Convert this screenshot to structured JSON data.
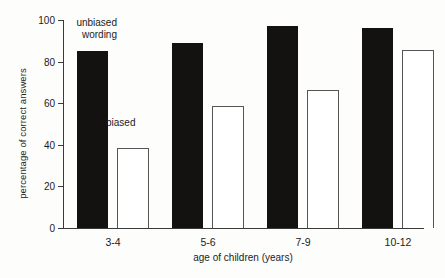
{
  "chart_data": {
    "type": "bar",
    "title": "",
    "subtitle": "",
    "xlabel": "age of children (years)",
    "ylabel": "percentage of correct answers",
    "categories": [
      "3-4",
      "5-6",
      "7-9",
      "10-12"
    ],
    "series": [
      {
        "name": "unbiased wording",
        "values": [
          84,
          88,
          96,
          95
        ],
        "style": "filled-black"
      },
      {
        "name": "biased",
        "values": [
          38,
          58,
          66,
          85
        ],
        "style": "open-outline"
      }
    ],
    "ylim": [
      0,
      100
    ],
    "yticks": [
      0,
      20,
      40,
      60,
      80,
      100
    ],
    "ytick_labels": [
      "0",
      "20",
      "40",
      "60",
      "80",
      "100"
    ],
    "grid": false,
    "legend_position": "in-plot-annotations",
    "annotations": [
      {
        "text": "unbiased\nwording",
        "series": "unbiased wording"
      },
      {
        "text": "biased",
        "series": "biased"
      }
    ]
  },
  "colors": {
    "bar_dark": "#141210",
    "bar_light_fill": "#ffffff",
    "bar_light_stroke": "#555555",
    "axis": "#3a3a3a",
    "text": "#1c1c1c",
    "background": "#fdfdfb"
  }
}
